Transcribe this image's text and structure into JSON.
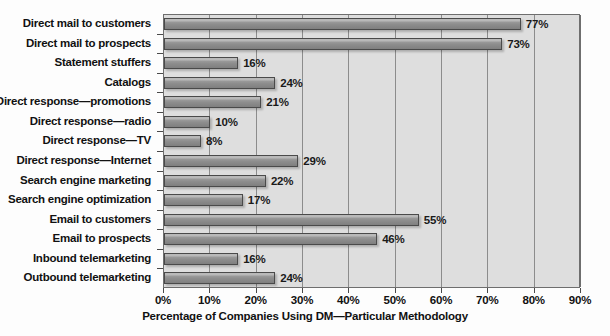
{
  "chart_data": {
    "type": "bar",
    "orientation": "horizontal",
    "title": "",
    "xlabel": "Percentage of Companies Using DM—Particular Methodology",
    "ylabel": "",
    "xlim": [
      0,
      90
    ],
    "xtick_labels": [
      "0%",
      "10%",
      "20%",
      "30%",
      "40%",
      "50%",
      "60%",
      "70%",
      "80%",
      "90%"
    ],
    "xtick_values": [
      0,
      10,
      20,
      30,
      40,
      50,
      60,
      70,
      80,
      90
    ],
    "grid": true,
    "legend": "none",
    "value_label_suffix": "%",
    "categories": [
      "Direct mail to customers",
      "Direct mail to prospects",
      "Statement stuffers",
      "Catalogs",
      "Direct response—promotions",
      "Direct response—radio",
      "Direct response—TV",
      "Direct response—Internet",
      "Search engine marketing",
      "Search engine optimization",
      "Email to customers",
      "Email to prospects",
      "Inbound telemarketing",
      "Outbound telemarketing"
    ],
    "values": [
      77,
      73,
      16,
      24,
      21,
      10,
      8,
      29,
      22,
      17,
      55,
      46,
      16,
      24
    ],
    "value_labels": [
      "77%",
      "73%",
      "16%",
      "24%",
      "21%",
      "10%",
      "8%",
      "29%",
      "22%",
      "17%",
      "55%",
      "46%",
      "16%",
      "24%"
    ],
    "colors": {
      "bar_fill": "#8d8d8d",
      "bar_border": "#4a4a4a",
      "plot_background": "#dedede",
      "gridline": "#8c8c8c",
      "axis": "#6e6e6e",
      "text": "#111111",
      "page_background": "#fdfdfd"
    }
  }
}
